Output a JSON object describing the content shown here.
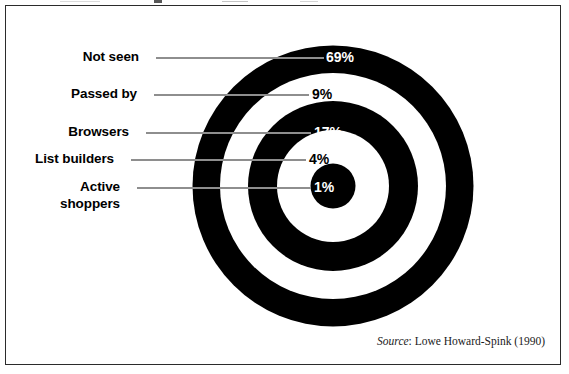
{
  "figure": {
    "kind": "concentric-target-chart",
    "source_label": "Source",
    "source_text": ": Lowe Howard-Spink (1990)"
  },
  "chart_data": {
    "type": "pie",
    "title": "",
    "subtitle": "",
    "xlabel": "",
    "ylabel": "",
    "legend_position": "left-leader-labels",
    "grid": false,
    "units": "%",
    "note": "Concentric bullseye / target diagram; rings drawn from outside inwards. Ring band area is not proportional to value; value is printed on each band.",
    "categories": [
      "Not seen",
      "Passed by",
      "Browsers",
      "List builders",
      "Active shoppers"
    ],
    "values": [
      69,
      9,
      17,
      4,
      1
    ],
    "value_labels": [
      "69%",
      "9%",
      "17%",
      "4%",
      "1%"
    ],
    "rings": [
      {
        "label": "Not seen",
        "value": 69,
        "value_label": "69%",
        "band": "outer",
        "fill": "#000000",
        "text_color": "#ffffff"
      },
      {
        "label": "Passed by",
        "value": 9,
        "value_label": "9%",
        "band": "second",
        "fill": "#ffffff",
        "text_color": "#000000"
      },
      {
        "label": "Browsers",
        "value": 17,
        "value_label": "17%",
        "band": "third",
        "fill": "#000000",
        "text_color": "#ffffff"
      },
      {
        "label": "List builders",
        "value": 4,
        "value_label": "4%",
        "band": "fourth",
        "fill": "#ffffff",
        "text_color": "#000000"
      },
      {
        "label": "Active shoppers",
        "value": 1,
        "value_label": "1%",
        "band": "center",
        "fill": "#000000",
        "text_color": "#ffffff"
      }
    ],
    "label_lines": {
      "active_shoppers_line1": "Active",
      "active_shoppers_line2": "shoppers"
    }
  },
  "colors": {
    "ink": "#000000",
    "paper": "#ffffff",
    "leader_line": "#8e8e8e",
    "frame_border": "#2b2b2b"
  }
}
